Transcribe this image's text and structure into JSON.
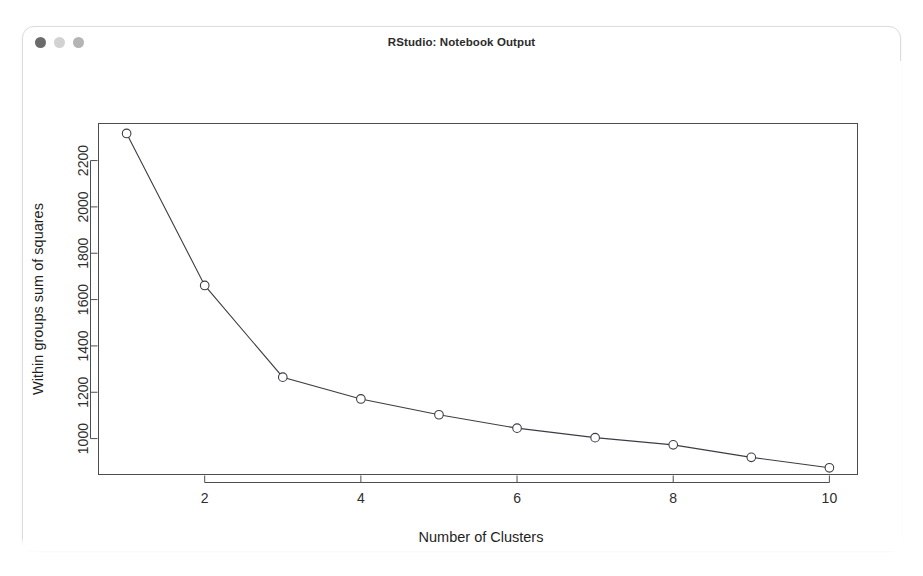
{
  "window": {
    "title": "RStudio: Notebook Output",
    "traffic_lights": [
      {
        "name": "close",
        "color": "#6b6b6b"
      },
      {
        "name": "minimize",
        "color": "#d2d2d2"
      },
      {
        "name": "maximize",
        "color": "#b4b4b4"
      }
    ]
  },
  "chart_data": {
    "type": "line",
    "title": "",
    "xlabel": "Number of Clusters",
    "ylabel": "Within groups sum of squares",
    "x": [
      1,
      2,
      3,
      4,
      5,
      6,
      7,
      8,
      9,
      10
    ],
    "values": [
      2317,
      1661,
      1265,
      1171,
      1103,
      1045,
      1004,
      973,
      919,
      874
    ],
    "series": [
      {
        "name": "Within groups sum of squares",
        "values": [
          2317,
          1661,
          1265,
          1171,
          1103,
          1045,
          1004,
          973,
          919,
          874
        ]
      }
    ],
    "xticks": [
      2,
      4,
      6,
      8,
      10
    ],
    "xtick_labels": [
      "2",
      "4",
      "6",
      "8",
      "10"
    ],
    "yticks": [
      1000,
      1200,
      1400,
      1600,
      1800,
      2000,
      2200
    ],
    "ytick_labels": [
      "1000",
      "1200",
      "1400",
      "1600",
      "1800",
      "2000",
      "2200"
    ],
    "xlim": [
      0.64,
      10.36
    ],
    "ylim": [
      845,
      2360
    ],
    "grid": false,
    "legend": null,
    "marker": "open-circle",
    "line_color": "#3c3c46",
    "frame": true
  }
}
